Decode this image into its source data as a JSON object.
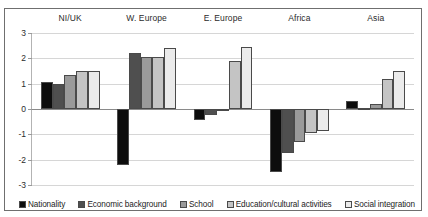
{
  "chart_data": {
    "type": "bar",
    "title": "",
    "subtitle": "",
    "xlabel": "",
    "ylabel": "",
    "ylim": [
      -3,
      3
    ],
    "yticks": [
      3,
      2,
      1,
      0,
      -1,
      -2,
      -3
    ],
    "ytick_labels": [
      "3",
      "2",
      "1",
      "0",
      "-1",
      "-2",
      "-3"
    ],
    "grid": true,
    "legend_position": "bottom",
    "categories": [
      "NI/UK",
      "W. Europe",
      "E. Europe",
      "Africa",
      "Asia"
    ],
    "series": [
      {
        "name": "Nationality",
        "color": "#0d0d0d",
        "values": [
          1.05,
          -2.2,
          -0.45,
          -2.5,
          0.3
        ]
      },
      {
        "name": "Economic background",
        "color": "#4f4f4f",
        "values": [
          1.0,
          2.2,
          -0.25,
          -1.75,
          0.05
        ]
      },
      {
        "name": "School",
        "color": "#9a9a9a",
        "values": [
          1.35,
          2.05,
          0.0,
          -1.3,
          0.2
        ]
      },
      {
        "name": "Education/cultural activities",
        "color": "#c4c4c4",
        "values": [
          1.5,
          2.05,
          1.9,
          -0.95,
          1.2
        ]
      },
      {
        "name": "Social integration",
        "color": "#ebebeb",
        "values": [
          1.5,
          2.4,
          2.45,
          -0.85,
          1.5
        ]
      }
    ]
  }
}
